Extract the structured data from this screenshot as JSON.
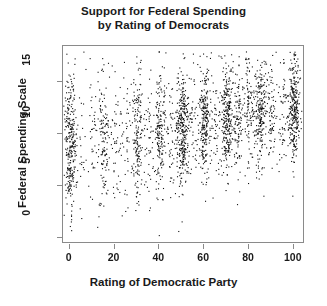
{
  "chart_data": {
    "type": "scatter",
    "title": "Support for Federal Spending by Rating of Democrats",
    "title_lines": [
      "Support for Federal Spending",
      "by Rating of Democrats"
    ],
    "xlabel": "Rating of Democratic Party",
    "ylabel": "Federal Spending Scale",
    "xlim": [
      -3,
      105
    ],
    "ylim": [
      -0.6,
      18.5
    ],
    "xticks": [
      0,
      20,
      40,
      60,
      80,
      100
    ],
    "xtick_labels": [
      "0",
      "20",
      "40",
      "60",
      "80",
      "100"
    ],
    "yticks": [
      0,
      5,
      10,
      15
    ],
    "ytick_labels": [
      "0",
      "5",
      "10",
      "15"
    ],
    "grid": false,
    "legend": null,
    "point_color": "#111111",
    "point_size": 1.1,
    "frame_color": "#8a8a8a",
    "note": "Rating is a 0-100 feeling-thermometer; responses pile up on round values so points form dense vertical stripes.",
    "clusters": [
      {
        "x": 0,
        "n": 300,
        "y_mean": 9.3,
        "y_sd": 3.3,
        "jitter": 1.4
      },
      {
        "x": 5,
        "n": 22,
        "y_mean": 9.2,
        "y_sd": 3.3,
        "jitter": 1.2
      },
      {
        "x": 10,
        "n": 40,
        "y_mean": 9.4,
        "y_sd": 3.2,
        "jitter": 1.3
      },
      {
        "x": 15,
        "n": 130,
        "y_mean": 9.6,
        "y_sd": 3.2,
        "jitter": 1.3
      },
      {
        "x": 20,
        "n": 48,
        "y_mean": 9.7,
        "y_sd": 3.1,
        "jitter": 1.4
      },
      {
        "x": 25,
        "n": 40,
        "y_mean": 9.8,
        "y_sd": 3.1,
        "jitter": 1.3
      },
      {
        "x": 30,
        "n": 175,
        "y_mean": 10.0,
        "y_sd": 3.0,
        "jitter": 1.3
      },
      {
        "x": 35,
        "n": 45,
        "y_mean": 10.1,
        "y_sd": 3.0,
        "jitter": 1.3
      },
      {
        "x": 40,
        "n": 185,
        "y_mean": 10.3,
        "y_sd": 3.0,
        "jitter": 1.3
      },
      {
        "x": 45,
        "n": 45,
        "y_mean": 10.4,
        "y_sd": 2.9,
        "jitter": 1.2
      },
      {
        "x": 50,
        "n": 330,
        "y_mean": 10.6,
        "y_sd": 2.9,
        "jitter": 1.4
      },
      {
        "x": 55,
        "n": 48,
        "y_mean": 10.8,
        "y_sd": 2.8,
        "jitter": 1.2
      },
      {
        "x": 60,
        "n": 250,
        "y_mean": 11.0,
        "y_sd": 2.8,
        "jitter": 1.3
      },
      {
        "x": 65,
        "n": 55,
        "y_mean": 11.2,
        "y_sd": 2.7,
        "jitter": 1.2
      },
      {
        "x": 70,
        "n": 265,
        "y_mean": 11.4,
        "y_sd": 2.7,
        "jitter": 1.3
      },
      {
        "x": 75,
        "n": 120,
        "y_mean": 11.6,
        "y_sd": 2.7,
        "jitter": 1.2
      },
      {
        "x": 80,
        "n": 110,
        "y_mean": 11.8,
        "y_sd": 2.6,
        "jitter": 1.3
      },
      {
        "x": 85,
        "n": 230,
        "y_mean": 12.0,
        "y_sd": 2.6,
        "jitter": 1.3
      },
      {
        "x": 90,
        "n": 70,
        "y_mean": 12.2,
        "y_sd": 2.5,
        "jitter": 1.2
      },
      {
        "x": 95,
        "n": 60,
        "y_mean": 12.3,
        "y_sd": 2.5,
        "jitter": 1.2
      },
      {
        "x": 100,
        "n": 300,
        "y_mean": 12.6,
        "y_sd": 2.5,
        "jitter": 1.2
      }
    ]
  }
}
